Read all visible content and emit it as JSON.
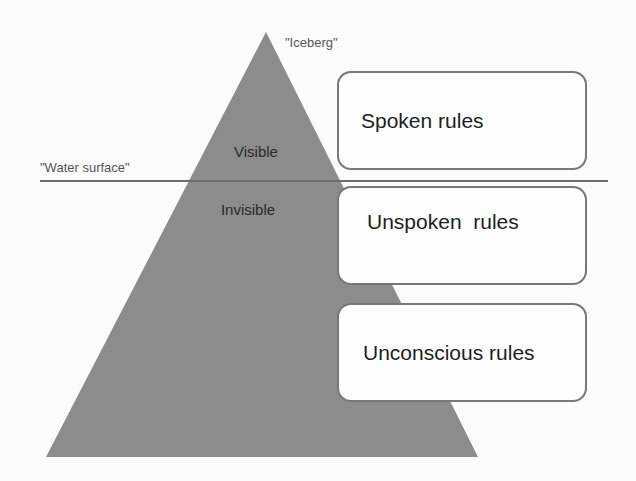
{
  "diagram": {
    "iceberg_label": "\"Iceberg\"",
    "water_label": "\"Water surface\"",
    "visible_label": "Visible",
    "invisible_label": "Invisible",
    "boxes": [
      {
        "label": "Spoken rules"
      },
      {
        "label": "Unspoken  rules"
      },
      {
        "label": "Unconscious rules"
      }
    ],
    "colors": {
      "triangle": "#8c8c8c",
      "line": "#6e6e6e",
      "box_border": "#777777"
    }
  }
}
